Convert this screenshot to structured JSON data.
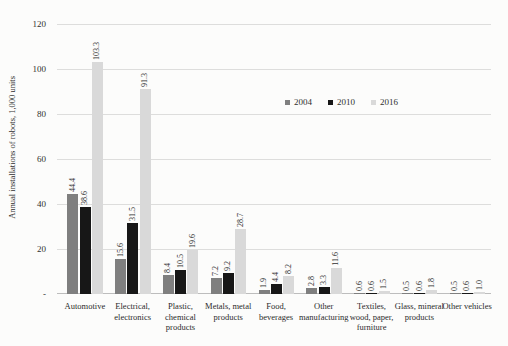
{
  "chart_data": {
    "type": "bar",
    "title": "",
    "ylabel": "Annual installations of robots, 1,000 units",
    "xlabel": "",
    "ylim": [
      0,
      120
    ],
    "ytick_interval": 20,
    "zero_tick_label": "-",
    "grid": true,
    "legend_position": "inside-top-center-right",
    "value_labels": "rotated vertical, one decimal, above each bar",
    "categories": [
      "Automotive",
      "Electrical, electronics",
      "Plastic, chemical products",
      "Metals, metal products",
      "Food, beverages",
      "Other manufacturing",
      "Textiles, wood, paper, furniture",
      "Glass, mineral products",
      "Other vehicles"
    ],
    "category_label_lines": [
      [
        "Automotive"
      ],
      [
        "Electrical,",
        "electronics"
      ],
      [
        "Plastic,",
        "chemical",
        "products"
      ],
      [
        "Metals, metal",
        "products"
      ],
      [
        "Food,",
        "beverages"
      ],
      [
        "Other",
        "manufacturing"
      ],
      [
        "Textiles,",
        "wood, paper,",
        "furniture"
      ],
      [
        "Glass, mineral",
        "products"
      ],
      [
        "Other vehicles"
      ]
    ],
    "series": [
      {
        "name": "2004",
        "color": "#7f7f7f",
        "values": [
          44.4,
          15.6,
          8.4,
          7.2,
          1.9,
          2.8,
          0.6,
          0.5,
          0.5
        ]
      },
      {
        "name": "2010",
        "color": "#171717",
        "values": [
          38.6,
          31.5,
          10.5,
          9.2,
          4.4,
          3.3,
          0.6,
          0.6,
          0.6
        ]
      },
      {
        "name": "2016",
        "color": "#d9d9d9",
        "values": [
          103.3,
          91.3,
          19.6,
          28.7,
          8.2,
          11.6,
          1.5,
          1.8,
          1.0
        ]
      }
    ],
    "colors": {
      "gridline": "#dddddc",
      "axis_line": "#bdbdbd",
      "text": "#303030",
      "background": "#fcfcfb"
    }
  }
}
